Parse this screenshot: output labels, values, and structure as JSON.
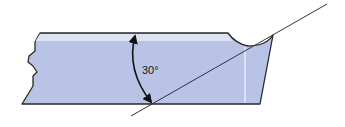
{
  "diagram": {
    "angle_label": "30°",
    "colors": {
      "fill": "#b9c3e6",
      "highlight": "#dde3f5",
      "outline": "#2a2a2a",
      "line": "#333333",
      "background": "#ffffff"
    }
  }
}
